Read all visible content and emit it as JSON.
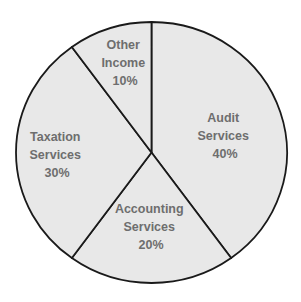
{
  "chart_data": {
    "type": "pie",
    "title": "",
    "categories": [
      "Audit Services",
      "Accounting Services",
      "Taxation Services",
      "Other Income"
    ],
    "values": [
      40,
      20,
      30,
      10
    ],
    "unit": "%",
    "start_angle_deg": 0,
    "direction": "clockwise",
    "legend": "none",
    "slices": [
      {
        "name": "Audit Services",
        "value": 40,
        "lines": [
          "Audit",
          "Services",
          "40%"
        ],
        "fill": "#e8e8e8"
      },
      {
        "name": "Accounting Services",
        "value": 20,
        "lines": [
          "Accounting",
          "Services",
          "20%"
        ],
        "fill": "#e8e8e8"
      },
      {
        "name": "Taxation Services",
        "value": 30,
        "lines": [
          "Taxation",
          "Services",
          "30%"
        ],
        "fill": "#e8e8e8"
      },
      {
        "name": "Other Income",
        "value": 10,
        "lines": [
          "Other",
          "Income",
          "10%"
        ],
        "fill": "#e8e8e8"
      }
    ]
  },
  "style": {
    "stroke_color": "#1a1a1a",
    "label_color": "#6e6e6e",
    "background": "#ffffff"
  }
}
